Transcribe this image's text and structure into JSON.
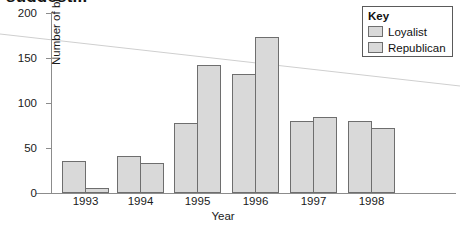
{
  "chart_data": {
    "type": "bar",
    "title": "suggest...",
    "xlabel": "Year",
    "ylabel": "Number of beatings",
    "categories": [
      "1993",
      "1994",
      "1995",
      "1996",
      "1997",
      "1998"
    ],
    "series": [
      {
        "name": "Loyalist",
        "values": [
          36,
          41,
          78,
          132,
          80,
          80
        ]
      },
      {
        "name": "Republican",
        "values": [
          6,
          33,
          142,
          173,
          84,
          72
        ]
      }
    ],
    "ylim": [
      0,
      200
    ],
    "yticks": [
      0,
      50,
      100,
      150,
      200
    ],
    "ytick_labels": [
      "0",
      "50",
      "100",
      "150",
      "200"
    ],
    "grid": false,
    "legend": {
      "title": "Key",
      "position": "top-right"
    },
    "bar_fill": "#d9d9d9",
    "bar_border": "#6e6e6e",
    "axis_color": "#8c8c8c"
  }
}
